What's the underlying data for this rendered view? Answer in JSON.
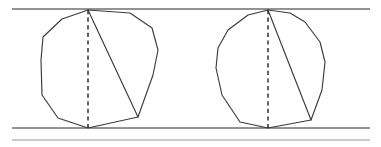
{
  "figure": {
    "background_color": "#ffffff",
    "width": 381,
    "height": 147,
    "ink_color": "#3b3b3b",
    "rail_color": "#6f6f6f",
    "rail_faint_color": "#b9b9b9",
    "dash_color": "#2f2f2f"
  },
  "chart_data": {
    "type": "scatter",
    "xlabel": "",
    "ylabel": "",
    "xlim": [
      0,
      381
    ],
    "ylim": [
      147,
      0
    ],
    "grid": false,
    "legend": "none",
    "series": [
      {
        "name": "top-rail",
        "kind": "line",
        "points": [
          [
            12,
            9
          ],
          [
            370,
            9
          ]
        ]
      },
      {
        "name": "bottom-rail",
        "kind": "line",
        "points": [
          [
            12,
            128
          ],
          [
            370,
            128
          ]
        ]
      },
      {
        "name": "bottom-rail-secondary",
        "kind": "line",
        "points": [
          [
            12,
            140
          ],
          [
            370,
            140
          ]
        ]
      },
      {
        "name": "left-polygon",
        "kind": "polygon",
        "points": [
          [
            88,
            10
          ],
          [
            130,
            13
          ],
          [
            152,
            28
          ],
          [
            158,
            50
          ],
          [
            153,
            75
          ],
          [
            138,
            117
          ],
          [
            88,
            128
          ],
          [
            58,
            118
          ],
          [
            42,
            95
          ],
          [
            41,
            60
          ],
          [
            43,
            37
          ],
          [
            62,
            19
          ]
        ]
      },
      {
        "name": "left-polygon-chord",
        "kind": "line",
        "points": [
          [
            88,
            10
          ],
          [
            138,
            117
          ]
        ]
      },
      {
        "name": "left-polygon-diameter",
        "kind": "dashed-line",
        "points": [
          [
            88,
            10
          ],
          [
            88,
            128
          ]
        ]
      },
      {
        "name": "right-polygon",
        "kind": "polygon",
        "points": [
          [
            268,
            10
          ],
          [
            290,
            13
          ],
          [
            305,
            22
          ],
          [
            320,
            42
          ],
          [
            325,
            62
          ],
          [
            322,
            90
          ],
          [
            311,
            120
          ],
          [
            268,
            128
          ],
          [
            240,
            122
          ],
          [
            222,
            95
          ],
          [
            216,
            68
          ],
          [
            218,
            48
          ],
          [
            228,
            30
          ],
          [
            248,
            15
          ]
        ]
      },
      {
        "name": "right-polygon-chord",
        "kind": "line",
        "points": [
          [
            268,
            10
          ],
          [
            311,
            120
          ]
        ]
      },
      {
        "name": "right-polygon-diameter",
        "kind": "dashed-line",
        "points": [
          [
            268,
            10
          ],
          [
            268,
            128
          ]
        ]
      }
    ]
  }
}
